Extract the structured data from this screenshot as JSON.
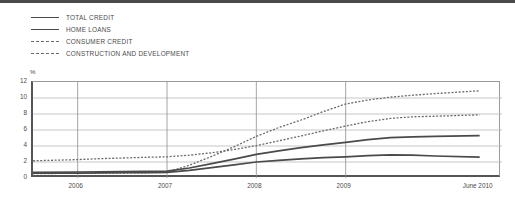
{
  "figure": {
    "has_top_rule": true,
    "background": "#ffffff"
  },
  "legend": {
    "position": "top-left",
    "items": [
      {
        "label": "TOTAL CREDIT",
        "style": "solid",
        "color": "#4a4a4a"
      },
      {
        "label": "HOME LOANS",
        "style": "solid",
        "color": "#4a4a4a"
      },
      {
        "label": "CONSUMER CREDIT",
        "style": "dashed",
        "color": "#6a6a6a"
      },
      {
        "label": "CONSTRUCTION AND DEVELOPMENT",
        "style": "dashed",
        "color": "#6a6a6a"
      }
    ]
  },
  "axis": {
    "y_unit": "%",
    "y_ticks": [
      "12",
      "10",
      "8",
      "6",
      "4",
      "2",
      "0"
    ],
    "x_ticks": [
      "2006",
      "2007",
      "2008",
      "2009",
      "June 2010"
    ]
  },
  "chart_data": {
    "type": "line",
    "title": "",
    "subtitle": "",
    "xlabel": "",
    "ylabel": "%",
    "ylim": [
      0,
      12
    ],
    "xlim": [
      2005.5,
      2010.75
    ],
    "grid": true,
    "legend_position": "top-left",
    "x": [
      2005.5,
      2006.0,
      2006.25,
      2006.5,
      2006.75,
      2007.0,
      2007.25,
      2007.5,
      2007.75,
      2008.0,
      2008.25,
      2008.5,
      2008.75,
      2009.0,
      2009.25,
      2009.5,
      2009.75,
      2010.0,
      2010.5
    ],
    "x_tick_values": [
      2006,
      2007,
      2008,
      2009,
      2010.5
    ],
    "series": [
      {
        "name": "TOTAL CREDIT",
        "style": "solid",
        "color": "#4a4a4a",
        "values": [
          0.7,
          0.75,
          0.78,
          0.8,
          0.82,
          0.85,
          1.25,
          1.8,
          2.35,
          2.95,
          3.4,
          3.8,
          4.15,
          4.45,
          4.8,
          5.05,
          5.15,
          5.2,
          5.3
        ]
      },
      {
        "name": "HOME LOANS",
        "style": "solid",
        "color": "#4a4a4a",
        "values": [
          0.6,
          0.62,
          0.64,
          0.66,
          0.68,
          0.7,
          0.95,
          1.3,
          1.65,
          2.0,
          2.2,
          2.4,
          2.55,
          2.65,
          2.8,
          2.88,
          2.85,
          2.75,
          2.6
        ]
      },
      {
        "name": "CONSUMER CREDIT",
        "style": "dashed",
        "color": "#6a6a6a",
        "values": [
          2.15,
          2.3,
          2.42,
          2.5,
          2.58,
          2.65,
          2.85,
          3.15,
          3.55,
          4.05,
          4.65,
          5.25,
          5.9,
          6.5,
          7.05,
          7.45,
          7.65,
          7.72,
          7.9
        ]
      },
      {
        "name": "CONSTRUCTION AND DEVELOPMENT",
        "style": "dashed",
        "color": "#6a6a6a",
        "values": [
          0.55,
          0.58,
          0.6,
          0.62,
          0.65,
          0.7,
          1.6,
          2.7,
          3.9,
          5.2,
          6.3,
          7.25,
          8.3,
          9.25,
          9.75,
          10.1,
          10.35,
          10.55,
          10.9
        ]
      }
    ]
  }
}
